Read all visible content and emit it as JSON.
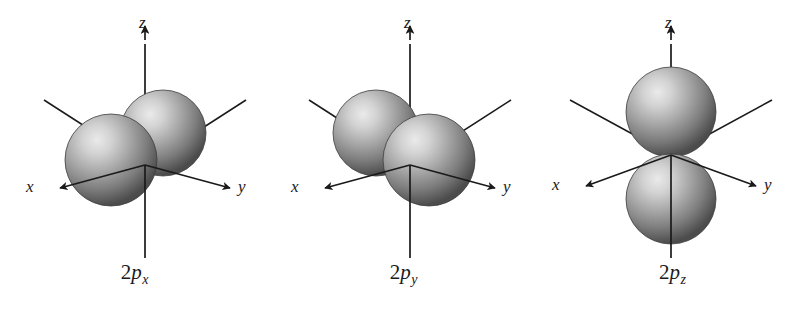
{
  "figure": {
    "background_color": "#ffffff",
    "width": 806,
    "height": 311
  },
  "style": {
    "axis_color": "#1a1a1a",
    "lobe_highlight_color": "#e8e8e8",
    "lobe_mid_color": "#9a9a9a",
    "lobe_edge_color": "#4a4a4a",
    "lobe_outline_color": "#3a3a3a",
    "text_color": "#1a1a1a"
  },
  "axes": {
    "z_label": "z",
    "x_label": "x",
    "y_label": "y"
  },
  "panels": [
    {
      "id": "2px",
      "caption_prefix": "2",
      "caption_symbol": "p",
      "caption_subscript": "x",
      "caption_full": "2px",
      "orientation": "x",
      "lobe_count": 2,
      "lobe_arrangement": "along-x-axis-horizontal-pair",
      "left_offset": 0
    },
    {
      "id": "2py",
      "caption_prefix": "2",
      "caption_symbol": "p",
      "caption_subscript": "y",
      "caption_full": "2py",
      "orientation": "y",
      "lobe_count": 2,
      "lobe_arrangement": "along-y-axis-diagonal-pair",
      "left_offset": 269
    },
    {
      "id": "2pz",
      "caption_prefix": "2",
      "caption_symbol": "p",
      "caption_subscript": "z",
      "caption_full": "2pz",
      "orientation": "z",
      "lobe_count": 2,
      "lobe_arrangement": "along-z-axis-vertical-pair",
      "left_offset": 538
    }
  ]
}
